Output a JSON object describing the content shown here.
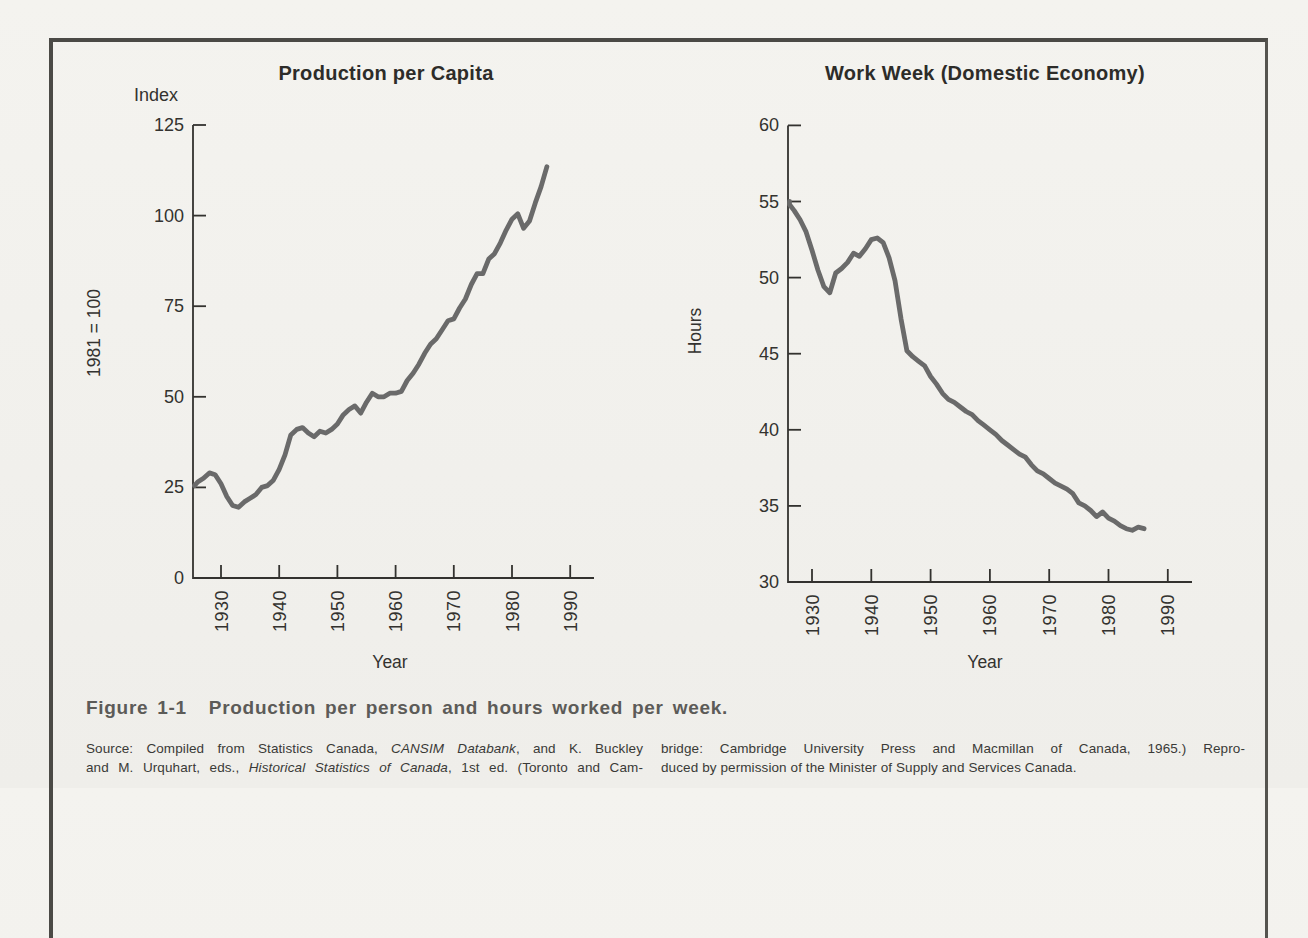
{
  "page": {
    "background": "#f2f1ed",
    "frame_border_color": "#4b4a46",
    "text_color": "#33322f"
  },
  "caption": {
    "label": "Figure 1-1",
    "title": "Production per person and hours worked per week."
  },
  "source": {
    "left_lines": [
      {
        "fill": true,
        "segs": [
          {
            "t": "Source: Compiled from Statistics Canada, "
          },
          {
            "t": "CANSIM Databank",
            "i": true
          },
          {
            "t": ", and K. Buckley"
          }
        ]
      },
      {
        "fill": true,
        "segs": [
          {
            "t": "and M. Urquhart, eds., "
          },
          {
            "t": "Historical Statistics of Canada",
            "i": true
          },
          {
            "t": ", 1st ed. (Toronto and Cam-"
          }
        ]
      }
    ],
    "right_lines": [
      {
        "fill": true,
        "segs": [
          {
            "t": "bridge: Cambridge University Press and Macmillan of Canada, 1965.) Repro-"
          }
        ]
      },
      {
        "fill": false,
        "segs": [
          {
            "t": "duced by permission of the Minister of Supply and Services Canada."
          }
        ]
      }
    ]
  },
  "chart_data": [
    {
      "type": "line",
      "title": "Production per Capita",
      "ylabel_top": "Index",
      "ylabel_side": "1981 = 100",
      "xlabel": "Year",
      "ylim": [
        0,
        125
      ],
      "yticks": [
        0,
        25,
        50,
        75,
        100,
        125
      ],
      "xticks": [
        1930,
        1940,
        1950,
        1960,
        1970,
        1980,
        1990
      ],
      "grid": false,
      "line_color": "#6a6a6a",
      "axis_color": "#33322f",
      "x": [
        1925,
        1926,
        1927,
        1928,
        1929,
        1930,
        1931,
        1932,
        1933,
        1934,
        1935,
        1936,
        1937,
        1938,
        1939,
        1940,
        1941,
        1942,
        1943,
        1944,
        1945,
        1946,
        1947,
        1948,
        1949,
        1950,
        1951,
        1952,
        1953,
        1954,
        1955,
        1956,
        1957,
        1958,
        1959,
        1960,
        1961,
        1962,
        1963,
        1964,
        1965,
        1966,
        1967,
        1968,
        1969,
        1970,
        1971,
        1972,
        1973,
        1974,
        1975,
        1976,
        1977,
        1978,
        1979,
        1980,
        1981,
        1982,
        1983,
        1984,
        1985,
        1986
      ],
      "values": [
        25.5,
        26.5,
        27.5,
        29,
        28.5,
        26,
        22.5,
        20,
        19.5,
        21,
        22,
        23,
        25,
        25.5,
        27,
        30,
        34,
        39.5,
        41,
        41.5,
        40,
        39,
        40.5,
        40,
        41,
        42.5,
        45,
        46.5,
        47.5,
        45.5,
        48.5,
        51,
        50,
        50,
        51,
        51,
        51.5,
        54.5,
        56.5,
        59,
        62,
        64.5,
        66,
        68.5,
        71,
        71.5,
        74.5,
        77,
        81,
        84,
        84,
        88,
        89.5,
        92.5,
        96,
        99,
        100.5,
        96.5,
        98.5,
        103.5,
        108,
        113.5
      ]
    },
    {
      "type": "line",
      "title": "Work Week (Domestic Economy)",
      "ylabel_side": "Hours",
      "xlabel": "Year",
      "ylim": [
        30,
        60
      ],
      "yticks": [
        30,
        35,
        40,
        45,
        50,
        55,
        60
      ],
      "xticks": [
        1930,
        1940,
        1950,
        1960,
        1970,
        1980,
        1990
      ],
      "grid": false,
      "line_color": "#6a6a6a",
      "axis_color": "#33322f",
      "x": [
        1925,
        1926,
        1927,
        1928,
        1929,
        1930,
        1931,
        1932,
        1933,
        1934,
        1935,
        1936,
        1937,
        1938,
        1939,
        1940,
        1941,
        1942,
        1943,
        1944,
        1945,
        1946,
        1947,
        1948,
        1949,
        1950,
        1951,
        1952,
        1953,
        1954,
        1955,
        1956,
        1957,
        1958,
        1959,
        1960,
        1961,
        1962,
        1963,
        1964,
        1965,
        1966,
        1967,
        1968,
        1969,
        1970,
        1971,
        1972,
        1973,
        1974,
        1975,
        1976,
        1977,
        1978,
        1979,
        1980,
        1981,
        1982,
        1983,
        1984,
        1985,
        1986
      ],
      "values": [
        55,
        54.8,
        54.4,
        53.8,
        53,
        51.8,
        50.5,
        49.4,
        49,
        50.3,
        50.6,
        51,
        51.6,
        51.4,
        51.9,
        52.5,
        52.6,
        52.3,
        51.3,
        49.8,
        47.3,
        45.2,
        44.8,
        44.5,
        44.2,
        43.5,
        43,
        42.4,
        42,
        41.8,
        41.5,
        41.2,
        41,
        40.6,
        40.3,
        40,
        39.7,
        39.3,
        39,
        38.7,
        38.4,
        38.2,
        37.7,
        37.3,
        37.1,
        36.8,
        36.5,
        36.3,
        36.1,
        35.8,
        35.2,
        35,
        34.7,
        34.3,
        34.6,
        34.2,
        34,
        33.7,
        33.5,
        33.4,
        33.6,
        33.5
      ]
    }
  ]
}
